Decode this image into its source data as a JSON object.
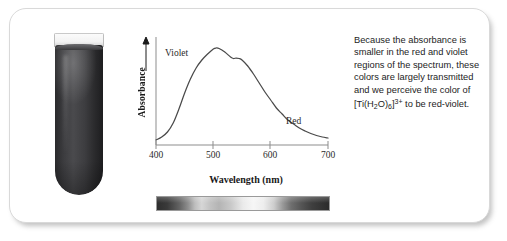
{
  "figure": {
    "card_background": "#ffffff",
    "border_color": "#d9d9d9"
  },
  "test_tube": {
    "name": "test-tube-with-red-violet-solution",
    "liquid_color": "#3c3c3f",
    "glass_color": "#f2f2f2"
  },
  "chart_data": {
    "type": "line",
    "title": "",
    "xlabel": "Wavelength (nm)",
    "ylabel": "Absorbance",
    "xlim": [
      400,
      700
    ],
    "ylim": [
      0,
      1
    ],
    "xticks": [
      400,
      500,
      600,
      700
    ],
    "xticklabels": [
      "400",
      "500",
      "600",
      "700"
    ],
    "yticks": [],
    "yticklabels": [],
    "grid": false,
    "legend": "none",
    "annotations": [
      {
        "text": "Violet",
        "x": 425,
        "y": 0.8
      },
      {
        "text": "Red",
        "x": 650,
        "y": 0.22
      }
    ],
    "series": [
      {
        "name": "Absorbance of [Ti(H2O)6]3+",
        "x": [
          400,
          410,
          420,
          430,
          440,
          450,
          460,
          470,
          480,
          490,
          500,
          505,
          510,
          520,
          530,
          535,
          540,
          545,
          550,
          560,
          570,
          580,
          590,
          600,
          610,
          620,
          630,
          640,
          650,
          660,
          670,
          680,
          690,
          700
        ],
        "values": [
          0.05,
          0.08,
          0.13,
          0.22,
          0.36,
          0.52,
          0.66,
          0.77,
          0.85,
          0.91,
          0.96,
          0.97,
          0.965,
          0.93,
          0.88,
          0.865,
          0.87,
          0.865,
          0.85,
          0.79,
          0.71,
          0.62,
          0.53,
          0.45,
          0.37,
          0.31,
          0.25,
          0.21,
          0.17,
          0.14,
          0.115,
          0.095,
          0.08,
          0.07
        ]
      }
    ]
  },
  "spectrum_bar": {
    "name": "visible-spectrum-transmission-bar",
    "description": "grayscale transmission strip from 400 nm to 700 nm"
  },
  "caption": {
    "line1": "Because the absorbance is",
    "line2": "smaller in the red and violet",
    "line3": "regions of the spectrum, these",
    "line4": "colors are largely transmitted",
    "line5": "and we perceive the color of",
    "formula_open": "[Ti(H",
    "formula_sub1": "2",
    "formula_mid": "O)",
    "formula_sub2": "6",
    "formula_close": "]",
    "formula_charge": "3+",
    "line6_tail": " to be red-violet."
  }
}
